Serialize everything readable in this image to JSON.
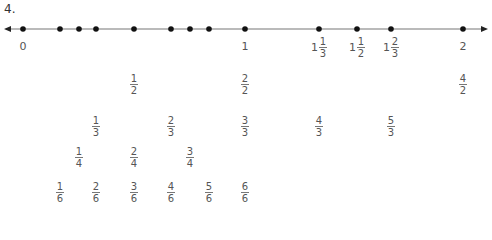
{
  "problem_number": "4.",
  "number_line": {
    "y": 29,
    "x_start": 4,
    "x_end": 488,
    "points_x": [
      23,
      60,
      79,
      96,
      134,
      171,
      190,
      209,
      245,
      319,
      357,
      391,
      463
    ],
    "labels": [
      {
        "text": "0",
        "x": 23
      },
      {
        "text": "1",
        "x": 245
      },
      {
        "text": "2",
        "x": 463
      }
    ],
    "mixed_labels": [
      {
        "whole": "1",
        "num": "1",
        "den": "3",
        "x": 319
      },
      {
        "whole": "1",
        "num": "1",
        "den": "2",
        "x": 357
      },
      {
        "whole": "1",
        "num": "2",
        "den": "3",
        "x": 391
      }
    ]
  },
  "fraction_rows": [
    {
      "y": 73,
      "items": [
        {
          "num": "1",
          "den": "2",
          "x": 134
        },
        {
          "num": "2",
          "den": "2",
          "x": 245
        },
        {
          "num": "4",
          "den": "2",
          "x": 463
        }
      ]
    },
    {
      "y": 115,
      "items": [
        {
          "num": "1",
          "den": "3",
          "x": 96
        },
        {
          "num": "2",
          "den": "3",
          "x": 171
        },
        {
          "num": "3",
          "den": "3",
          "x": 245
        },
        {
          "num": "4",
          "den": "3",
          "x": 319
        },
        {
          "num": "5",
          "den": "3",
          "x": 391
        }
      ]
    },
    {
      "y": 146,
      "items": [
        {
          "num": "1",
          "den": "4",
          "x": 79
        },
        {
          "num": "2",
          "den": "4",
          "x": 134
        },
        {
          "num": "3",
          "den": "4",
          "x": 190
        }
      ]
    },
    {
      "y": 181,
      "items": [
        {
          "num": "1",
          "den": "6",
          "x": 60
        },
        {
          "num": "2",
          "den": "6",
          "x": 96
        },
        {
          "num": "3",
          "den": "6",
          "x": 134
        },
        {
          "num": "4",
          "den": "6",
          "x": 171
        },
        {
          "num": "5",
          "den": "6",
          "x": 209
        },
        {
          "num": "6",
          "den": "6",
          "x": 245
        }
      ]
    }
  ]
}
